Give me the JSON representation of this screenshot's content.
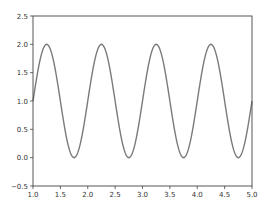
{
  "chart_data": {
    "type": "line",
    "title": "",
    "xlabel": "",
    "ylabel": "",
    "function": "y = 1 + sin(2*pi*x)",
    "xlim": [
      1.0,
      5.0
    ],
    "ylim": [
      -0.5,
      2.5
    ],
    "grid": false,
    "legend": null,
    "x_ticks": [
      1.0,
      1.5,
      2.0,
      2.5,
      3.0,
      3.5,
      4.0,
      4.5,
      5.0
    ],
    "x_tick_labels": [
      "1.0",
      "1.5",
      "2.0",
      "2.5",
      "3.0",
      "3.5",
      "4.0",
      "4.5",
      "5.0"
    ],
    "y_ticks": [
      -0.5,
      0.0,
      0.5,
      1.0,
      1.5,
      2.0,
      2.5
    ],
    "y_tick_labels": [
      "−0.5",
      "0.0",
      "0.5",
      "1.0",
      "1.5",
      "2.0",
      "2.5"
    ],
    "series": [
      {
        "name": "sine",
        "color": "#7a7a7a",
        "x": [
          1.0,
          1.25,
          1.5,
          1.75,
          2.0,
          2.25,
          2.5,
          2.75,
          3.0,
          3.25,
          3.5,
          3.75,
          4.0,
          4.25,
          4.5,
          4.75,
          5.0
        ],
        "values": [
          1.0,
          2.0,
          1.0,
          0.0,
          1.0,
          2.0,
          1.0,
          0.0,
          1.0,
          2.0,
          1.0,
          0.0,
          1.0,
          2.0,
          1.0,
          0.0,
          1.0
        ]
      }
    ]
  },
  "style": {
    "axis_color": "#444444",
    "line_color": "#7a7a7a",
    "background": "#ffffff"
  },
  "plot_area": {
    "left": 33,
    "top": 16,
    "right": 252,
    "bottom": 186
  }
}
